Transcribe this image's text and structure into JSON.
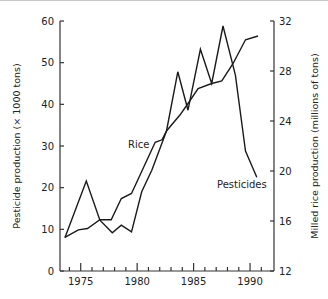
{
  "chart_data": {
    "type": "line",
    "title": "",
    "xlabel": "",
    "ylabel": "Pesticide production (× 1000 tons)",
    "ylabel_right": "Milled rice production (millions of tons)",
    "xlim": [
      1972.7,
      1991.5
    ],
    "ylim": [
      0,
      60
    ],
    "ylim_right": [
      12,
      32
    ],
    "x_ticks_major": [
      1975,
      1980,
      1985,
      1990
    ],
    "x_tick_labels": [
      "1975",
      "1980",
      "1985",
      "1990"
    ],
    "x_ticks_minor": [
      1974,
      1976,
      1977,
      1978,
      1979,
      1981,
      1982,
      1983,
      1984,
      1986,
      1987,
      1988,
      1989,
      1991
    ],
    "y_ticks": [
      0,
      10,
      20,
      30,
      40,
      50,
      60
    ],
    "y_tick_labels": [
      "0",
      "10",
      "20",
      "30",
      "40",
      "50",
      "60"
    ],
    "y_ticks_right": [
      12,
      16,
      20,
      24,
      28,
      32
    ],
    "y_tick_labels_right": [
      "12",
      "16",
      "20",
      "24",
      "28",
      "32"
    ],
    "grid": false,
    "legend": "none (direct line labels)",
    "series": [
      {
        "name": "Pesticides",
        "axis": "left",
        "label": "Pesticides",
        "x": [
          1973.6,
          1975.5,
          1976.7,
          1977.8,
          1978.6,
          1979.5,
          1980.4,
          1981.3,
          1982.6,
          1983.6,
          1984.5,
          1985.6,
          1986.6,
          1987.6,
          1988.7,
          1989.6,
          1990.6
        ],
        "values": [
          8.0,
          21.6,
          12.2,
          9.2,
          11.0,
          9.4,
          19.0,
          24.2,
          33.6,
          47.8,
          38.6,
          53.2,
          45.0,
          58.8,
          47.0,
          28.8,
          22.5
        ]
      },
      {
        "name": "Rice",
        "axis": "right",
        "label": "Rice",
        "x": [
          1973.6,
          1974.8,
          1975.6,
          1976.7,
          1977.7,
          1978.6,
          1979.5,
          1981.6,
          1982.2,
          1982.6,
          1983.8,
          1984.5,
          1985.4,
          1986.6,
          1987.5,
          1988.5,
          1989.6,
          1990.7
        ],
        "values": [
          14.7,
          15.3,
          15.4,
          16.1,
          16.1,
          17.8,
          18.2,
          22.3,
          22.5,
          23.2,
          24.5,
          25.4,
          26.6,
          27.0,
          27.2,
          28.6,
          30.5,
          30.8
        ]
      }
    ],
    "annotations": [
      {
        "text": "Rice",
        "near_x": 1980.2,
        "near_y_right": 22.3
      },
      {
        "text": "Pesticides",
        "near_x": 1987.5,
        "near_y_left": 20.5
      }
    ]
  },
  "layout": {
    "plot": {
      "left": 60,
      "right": 274,
      "top": 21,
      "bottom": 271
    },
    "x_px_per_year": 11.29,
    "x_ref_year": 1975,
    "x_ref_px": 80.7,
    "line_color": "#1a1a1a",
    "axis_color": "#333333"
  }
}
